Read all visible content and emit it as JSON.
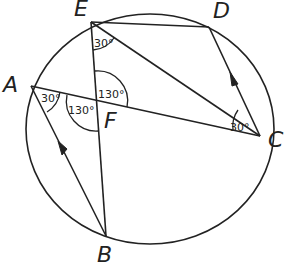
{
  "diagram": {
    "points": {
      "A": {
        "label": "A"
      },
      "B": {
        "label": "B"
      },
      "C": {
        "label": "C"
      },
      "D": {
        "label": "D"
      },
      "E": {
        "label": "E"
      },
      "F": {
        "label": "F"
      }
    },
    "angles": {
      "at_E": "30°",
      "at_A": "30°",
      "at_C": "30°",
      "EFC": "130°",
      "AFB": "130°"
    },
    "segments": [
      "ED",
      "DC (arrow)",
      "EC",
      "EB",
      "AC",
      "AB (arrow)"
    ],
    "colors": {
      "stroke": "#222222",
      "background": "#ffffff"
    }
  }
}
